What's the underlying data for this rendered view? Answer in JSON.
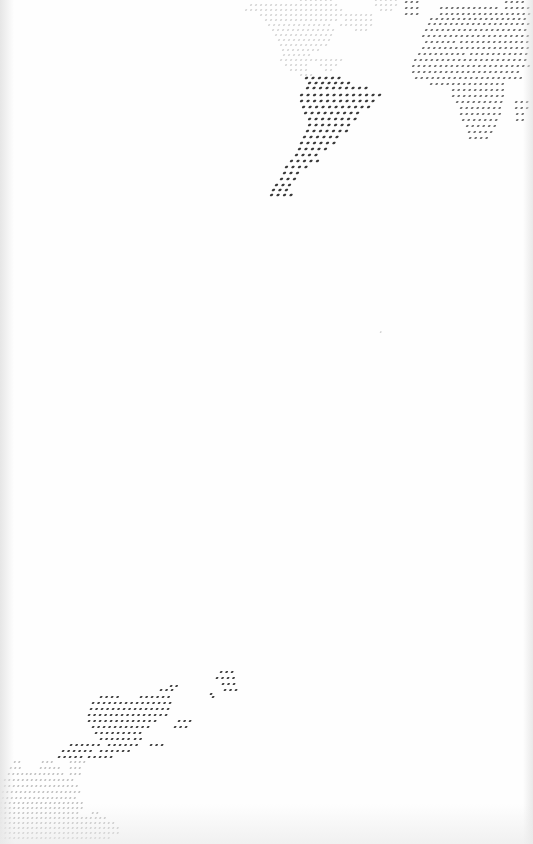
{
  "image": {
    "description": "Dotted halftone world map printed on white paper",
    "background_color": "#fefefe",
    "dot_color_dark": "#3a3a3a",
    "dot_color_mid": "#6e6e6e",
    "dot_color_light": "#a8a8a8",
    "dot_color_faint": "#c8c8c8"
  },
  "regions": [
    {
      "name": "north-america",
      "tone": "faint",
      "pitch": 5,
      "dot": 1.6,
      "rows": [
        [
          0,
          300,
          330
        ],
        [
          0,
          375,
          395
        ],
        [
          5,
          250,
          335
        ],
        [
          5,
          375,
          395
        ],
        [
          10,
          245,
          340
        ],
        [
          10,
          380,
          392
        ],
        [
          15,
          260,
          345
        ],
        [
          15,
          350,
          370
        ],
        [
          20,
          265,
          335
        ],
        [
          20,
          345,
          372
        ],
        [
          25,
          268,
          330
        ],
        [
          25,
          340,
          372
        ],
        [
          30,
          272,
          335
        ],
        [
          30,
          355,
          368
        ],
        [
          35,
          275,
          332
        ],
        [
          40,
          278,
          330
        ],
        [
          45,
          280,
          325
        ],
        [
          50,
          282,
          318
        ],
        [
          55,
          283,
          310
        ],
        [
          60,
          280,
          300
        ],
        [
          60,
          305,
          315
        ],
        [
          60,
          320,
          340
        ],
        [
          65,
          285,
          305
        ],
        [
          65,
          320,
          338
        ],
        [
          70,
          290,
          305
        ],
        [
          70,
          325,
          330
        ],
        [
          75,
          300,
          312
        ]
      ]
    },
    {
      "name": "south-america",
      "tone": "dark",
      "pitch": 6.5,
      "dot": 2.4,
      "rows": [
        [
          78,
          305,
          342
        ],
        [
          83,
          308,
          350
        ],
        [
          88,
          306,
          365
        ],
        [
          95,
          300,
          378
        ],
        [
          101,
          300,
          375
        ],
        [
          107,
          302,
          370
        ],
        [
          113,
          304,
          362
        ],
        [
          119,
          308,
          358
        ],
        [
          125,
          308,
          352
        ],
        [
          131,
          306,
          345
        ],
        [
          137,
          303,
          340
        ],
        [
          143,
          300,
          334
        ],
        [
          149,
          298,
          330
        ],
        [
          155,
          295,
          320
        ],
        [
          161,
          290,
          318
        ],
        [
          167,
          285,
          308
        ],
        [
          173,
          283,
          300
        ],
        [
          179,
          280,
          295
        ],
        [
          185,
          275,
          293
        ],
        [
          190,
          272,
          290
        ],
        [
          195,
          270,
          290
        ]
      ]
    },
    {
      "name": "europe-africa",
      "tone": "mid",
      "pitch": 5.5,
      "dot": 1.9,
      "rows": [
        [
          2,
          405,
          418
        ],
        [
          2,
          505,
          525
        ],
        [
          8,
          405,
          418
        ],
        [
          8,
          440,
          500
        ],
        [
          8,
          505,
          528
        ],
        [
          14,
          405,
          420
        ],
        [
          14,
          440,
          528
        ],
        [
          19,
          430,
          528
        ],
        [
          24,
          428,
          528
        ],
        [
          30,
          425,
          528
        ],
        [
          36,
          422,
          528
        ],
        [
          42,
          425,
          455
        ],
        [
          42,
          460,
          528
        ],
        [
          48,
          422,
          528
        ],
        [
          54,
          418,
          465
        ],
        [
          54,
          470,
          528
        ],
        [
          60,
          414,
          528
        ],
        [
          66,
          412,
          528
        ],
        [
          72,
          412,
          520
        ],
        [
          78,
          415,
          520
        ],
        [
          84,
          430,
          505
        ],
        [
          90,
          452,
          505
        ],
        [
          96,
          452,
          503
        ],
        [
          102,
          456,
          505
        ],
        [
          102,
          515,
          528
        ],
        [
          108,
          460,
          502
        ],
        [
          108,
          515,
          528
        ],
        [
          114,
          460,
          500
        ],
        [
          114,
          516,
          525
        ],
        [
          120,
          462,
          495
        ],
        [
          120,
          516,
          522
        ],
        [
          126,
          466,
          495
        ],
        [
          132,
          468,
          492
        ],
        [
          138,
          469,
          488
        ]
      ]
    },
    {
      "name": "asia-fragment-bottom",
      "tone": "dark",
      "pitch": 5.5,
      "dot": 2.0,
      "rows": [
        [
          672,
          220,
          236
        ],
        [
          678,
          216,
          236
        ],
        [
          684,
          222,
          238
        ],
        [
          686,
          170,
          176
        ],
        [
          690,
          160,
          175
        ],
        [
          690,
          224,
          238
        ],
        [
          694,
          210,
          214
        ],
        [
          697,
          100,
          118
        ],
        [
          697,
          140,
          172
        ],
        [
          697,
          212,
          216
        ],
        [
          703,
          92,
          170
        ],
        [
          709,
          90,
          170
        ],
        [
          715,
          88,
          168
        ],
        [
          721,
          88,
          158
        ],
        [
          721,
          178,
          192
        ],
        [
          727,
          92,
          148
        ],
        [
          727,
          174,
          188
        ],
        [
          733,
          95,
          142
        ],
        [
          739,
          100,
          130
        ],
        [
          739,
          134,
          140
        ],
        [
          745,
          70,
          98
        ],
        [
          745,
          108,
          140
        ],
        [
          745,
          150,
          162
        ],
        [
          751,
          62,
          92
        ],
        [
          751,
          100,
          130
        ],
        [
          757,
          58,
          80
        ],
        [
          757,
          88,
          110
        ]
      ]
    },
    {
      "name": "asia-fragment-left",
      "tone": "light",
      "pitch": 4.5,
      "dot": 1.5,
      "rows": [
        [
          762,
          14,
          20
        ],
        [
          762,
          42,
          55
        ],
        [
          762,
          70,
          85
        ],
        [
          768,
          10,
          22
        ],
        [
          768,
          40,
          58
        ],
        [
          768,
          70,
          80
        ],
        [
          774,
          8,
          28
        ],
        [
          774,
          30,
          62
        ],
        [
          774,
          70,
          80
        ],
        [
          780,
          4,
          75
        ],
        [
          786,
          4,
          76
        ],
        [
          792,
          2,
          80
        ],
        [
          798,
          2,
          78
        ],
        [
          803,
          0,
          82
        ],
        [
          808,
          0,
          85
        ],
        [
          813,
          0,
          80
        ],
        [
          813,
          92,
          100
        ],
        [
          818,
          0,
          90
        ],
        [
          818,
          95,
          105
        ],
        [
          823,
          0,
          115
        ],
        [
          828,
          0,
          118
        ],
        [
          833,
          0,
          120
        ],
        [
          838,
          0,
          110
        ]
      ]
    },
    {
      "name": "isolated-dot",
      "tone": "light",
      "pitch": 5,
      "dot": 1.2,
      "rows": [
        [
          332,
          380,
          381
        ]
      ]
    }
  ]
}
